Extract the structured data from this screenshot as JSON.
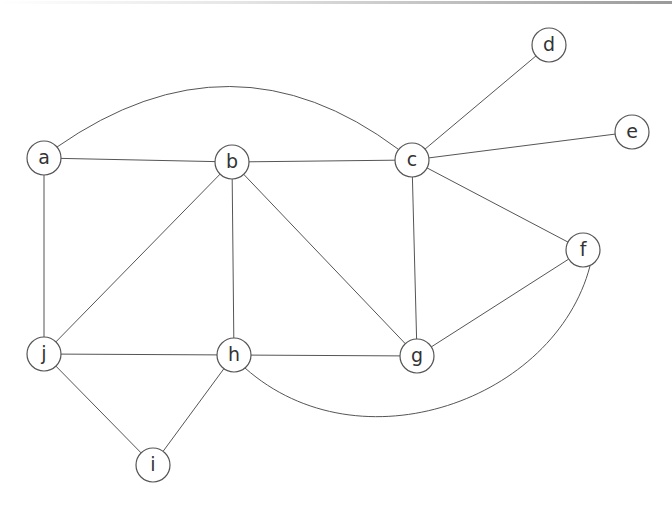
{
  "diagram": {
    "type": "undirected-graph",
    "colors": {
      "background": "#ffffff",
      "edge": "#555555",
      "node_stroke": "#555555",
      "node_fill": "#ffffff",
      "label": "#333333",
      "top_border": "#999999"
    },
    "node_radius": 17,
    "nodes": [
      {
        "id": "a",
        "label": "a",
        "x": 44,
        "y": 158
      },
      {
        "id": "b",
        "label": "b",
        "x": 232,
        "y": 162
      },
      {
        "id": "c",
        "label": "c",
        "x": 412,
        "y": 160
      },
      {
        "id": "d",
        "label": "d",
        "x": 549,
        "y": 45
      },
      {
        "id": "e",
        "label": "e",
        "x": 632,
        "y": 132
      },
      {
        "id": "f",
        "label": "f",
        "x": 583,
        "y": 250
      },
      {
        "id": "g",
        "label": "g",
        "x": 417,
        "y": 356
      },
      {
        "id": "h",
        "label": "h",
        "x": 234,
        "y": 355
      },
      {
        "id": "i",
        "label": "i",
        "x": 153,
        "y": 465
      },
      {
        "id": "j",
        "label": "j",
        "x": 44,
        "y": 354
      }
    ],
    "edges": [
      {
        "from": "a",
        "to": "b"
      },
      {
        "from": "a",
        "to": "c",
        "curve": "M 57 147 Q 232 25 398 149"
      },
      {
        "from": "a",
        "to": "j"
      },
      {
        "from": "b",
        "to": "c"
      },
      {
        "from": "b",
        "to": "h"
      },
      {
        "from": "b",
        "to": "j"
      },
      {
        "from": "b",
        "to": "g"
      },
      {
        "from": "c",
        "to": "d"
      },
      {
        "from": "c",
        "to": "e"
      },
      {
        "from": "c",
        "to": "f"
      },
      {
        "from": "c",
        "to": "g"
      },
      {
        "from": "f",
        "to": "g"
      },
      {
        "from": "f",
        "to": "h",
        "curve": "M 590 266 C 555 400 360 470 245 368"
      },
      {
        "from": "j",
        "to": "h"
      },
      {
        "from": "h",
        "to": "g"
      },
      {
        "from": "j",
        "to": "i"
      },
      {
        "from": "h",
        "to": "i"
      }
    ]
  }
}
